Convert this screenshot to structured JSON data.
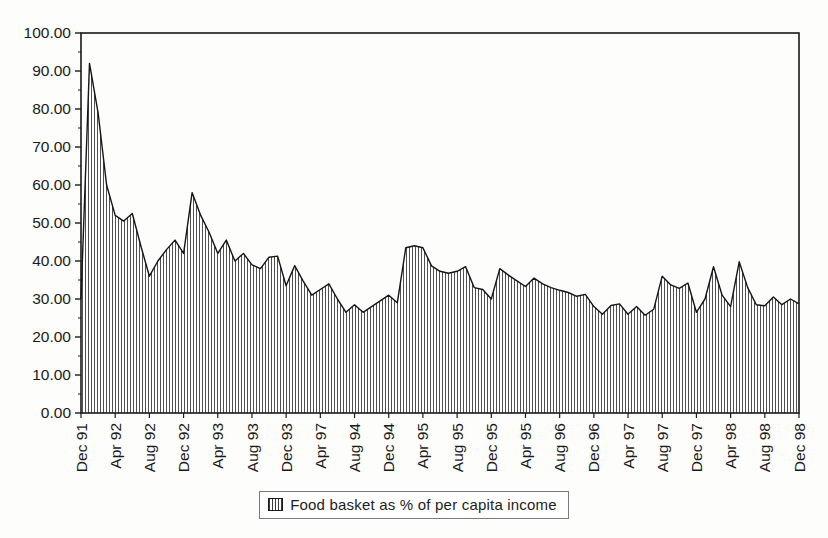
{
  "chart_data": {
    "type": "area",
    "title": "",
    "legend_label": "Food basket as % of per capita income",
    "legend_swatch": "vertical-line-pattern",
    "ylim": [
      0,
      100
    ],
    "y_tick_step": 10,
    "y_tick_labels": [
      "0.00",
      "10.00",
      "20.00",
      "30.00",
      "40.00",
      "50.00",
      "60.00",
      "70.00",
      "80.00",
      "90.00",
      "100.00"
    ],
    "x_tick_every": 4,
    "x_tick_labels": [
      "Dec 91",
      "Apr 92",
      "Aug 92",
      "Dec 92",
      "Apr 93",
      "Aug 93",
      "Dec 93",
      "Apr 97",
      "Aug 94",
      "Dec 94",
      "Apr 95",
      "Aug 95",
      "Dec 95",
      "Apr 95",
      "Aug 96",
      "Dec 96",
      "Apr 97",
      "Aug 97",
      "Dec 97",
      "Apr 98",
      "Aug 98",
      "Dec 98"
    ],
    "x_range_note": "monthly points from Dec 91 to Dec 98",
    "values": [
      30,
      92,
      79,
      60,
      52,
      50.5,
      52.5,
      44,
      36,
      40,
      43,
      45.5,
      42,
      58,
      52,
      47.5,
      42,
      45.5,
      40,
      42,
      39,
      38,
      41,
      41.3,
      33.5,
      38.8,
      34.7,
      31,
      32.5,
      34,
      30,
      26.5,
      28.5,
      26.5,
      28,
      29.5,
      31,
      29,
      43.5,
      44,
      43.5,
      38.7,
      37.3,
      36.8,
      37.3,
      38.5,
      33,
      32.5,
      30,
      38,
      36.3,
      34.8,
      33.3,
      35.5,
      34,
      33,
      32.3,
      31.7,
      30.7,
      31.2,
      28,
      26,
      28.3,
      28.7,
      26,
      28,
      25.7,
      27.3,
      36,
      33.7,
      32.8,
      34.2,
      26.5,
      30,
      38.5,
      31,
      28,
      39.8,
      33,
      28.5,
      28.2,
      30.5,
      28.5,
      30,
      28.7
    ],
    "grid": "off",
    "legend_position": "bottom-center",
    "colors": {
      "background": "#fdfdfc",
      "axis": "#1a1a1a",
      "outline": "#151515",
      "hatch": "#3c3c3c",
      "legend_border": "#7a7a7a"
    }
  }
}
